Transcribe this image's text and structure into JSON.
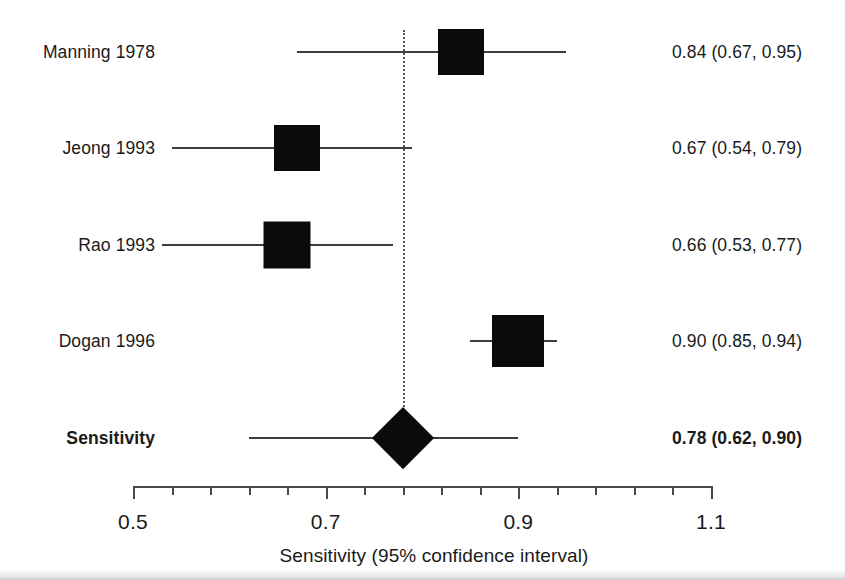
{
  "chart_data": {
    "type": "forest",
    "title": "",
    "xlabel": "Sensitivity (95% confidence interval)",
    "ylabel": "",
    "xlim": [
      0.5,
      1.1
    ],
    "x_major_ticks": [
      0.5,
      0.7,
      0.9,
      1.1
    ],
    "x_major_tick_labels": [
      "0.5",
      "0.7",
      "0.9",
      "1.1"
    ],
    "x_minor_tick_step": 0.04,
    "grid": false,
    "reference_line": 0.78,
    "reference_line_style": "dotted",
    "rows": [
      {
        "label": "Manning 1978",
        "estimate": 0.84,
        "ci_low": 0.67,
        "ci_high": 0.95,
        "stat_text": "0.84 (0.67, 0.95)",
        "marker": "box",
        "marker_size": 46,
        "summary": false
      },
      {
        "label": "Jeong 1993",
        "estimate": 0.67,
        "ci_low": 0.54,
        "ci_high": 0.79,
        "stat_text": "0.67 (0.54, 0.79)",
        "marker": "box",
        "marker_size": 46,
        "summary": false
      },
      {
        "label": "Rao 1993",
        "estimate": 0.66,
        "ci_low": 0.53,
        "ci_high": 0.77,
        "stat_text": "0.66 (0.53, 0.77)",
        "marker": "box",
        "marker_size": 47,
        "summary": false
      },
      {
        "label": "Dogan 1996",
        "estimate": 0.9,
        "ci_low": 0.85,
        "ci_high": 0.94,
        "stat_text": "0.90 (0.85, 0.94)",
        "marker": "box",
        "marker_size": 52,
        "summary": false
      },
      {
        "label": "Sensitivity",
        "estimate": 0.78,
        "ci_low": 0.62,
        "ci_high": 0.9,
        "stat_text": "0.78 (0.62, 0.90)",
        "marker": "diamond",
        "marker_size": 62,
        "summary": true
      }
    ],
    "colors": {
      "marker": "#0b0b0b",
      "ci_line": "#3d3d3d",
      "axis": "#4a4a4a",
      "reference_line": "#555555",
      "text": "#1a1a1a",
      "background": "#ffffff"
    }
  },
  "layout": {
    "plot_left_px": 133,
    "plot_right_px": 711,
    "label_right_px": 155,
    "stat_left_px": 672,
    "row_y_px": [
      52,
      148,
      245,
      341,
      438
    ],
    "axis_y_px": 486,
    "tick_label_y_px": 510,
    "axis_title_y_px": 545,
    "reference_top_px": 30,
    "reference_bottom_px": 430
  }
}
